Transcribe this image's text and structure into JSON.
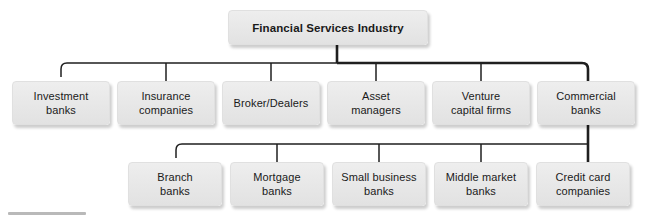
{
  "diagram": {
    "type": "organization-hierarchy",
    "title_node": {
      "label": "Financial Services Industry",
      "bold": true,
      "x": 228,
      "y": 10,
      "w": 200,
      "h": 35
    },
    "colors": {
      "box_fill_top": "#eeeeee",
      "box_fill_bottom": "#e2e2e2",
      "box_border": "#e0e0e0",
      "connector": "#1f1f1f",
      "text": "#1a1a1a",
      "background": "#ffffff",
      "bottom_rule": "#b9b9b9"
    },
    "levels": [
      {
        "name": "level-1",
        "nodes": [
          {
            "label": "Financial Services Industry"
          }
        ]
      },
      {
        "name": "level-2",
        "nodes": [
          {
            "label": "Investment\nbanks",
            "x": 12,
            "y": 81,
            "w": 98,
            "h": 44
          },
          {
            "label": "Insurance\ncompanies",
            "x": 117,
            "y": 81,
            "w": 98,
            "h": 44
          },
          {
            "label": "Broker/Dealers",
            "x": 222,
            "y": 81,
            "w": 98,
            "h": 44
          },
          {
            "label": "Asset\nmanagers",
            "x": 327,
            "y": 81,
            "w": 98,
            "h": 44
          },
          {
            "label": "Venture\ncapital firms",
            "x": 432,
            "y": 81,
            "w": 98,
            "h": 44
          },
          {
            "label": "Commercial\nbanks",
            "x": 537,
            "y": 81,
            "w": 98,
            "h": 44
          }
        ]
      },
      {
        "name": "level-3",
        "parent": "Commercial banks",
        "nodes": [
          {
            "label": "Branch\nbanks",
            "x": 128,
            "y": 162,
            "w": 94,
            "h": 44
          },
          {
            "label": "Mortgage\nbanks",
            "x": 230,
            "y": 162,
            "w": 94,
            "h": 44
          },
          {
            "label": "Small business\nbanks",
            "x": 332,
            "y": 162,
            "w": 94,
            "h": 44
          },
          {
            "label": "Middle market\nbanks",
            "x": 434,
            "y": 162,
            "w": 94,
            "h": 44
          },
          {
            "label": "Credit card\ncompanies",
            "x": 536,
            "y": 162,
            "w": 94,
            "h": 44
          }
        ]
      }
    ],
    "connectors": {
      "root_stub_x": 337,
      "bus_level2_y": 63,
      "bus_level2_x1": 61,
      "bus_level2_x2": 588,
      "bus_level3_y": 144,
      "bus_level3_x1": 176,
      "bus_level3_x2": 588,
      "trunk_x": 588,
      "level2_stub_x": [
        61,
        166,
        271,
        376,
        481,
        588
      ],
      "level3_stub_x": [
        176,
        277,
        379,
        481,
        588
      ]
    }
  }
}
